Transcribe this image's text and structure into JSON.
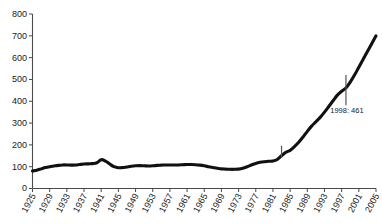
{
  "chart_data": {
    "type": "line",
    "title": "",
    "subtitle": "",
    "xlabel": "",
    "ylabel": "",
    "xlim": [
      1925,
      2005
    ],
    "ylim": [
      0,
      800
    ],
    "grid": false,
    "legend": null,
    "y_ticks": [
      0,
      100,
      200,
      300,
      400,
      500,
      600,
      700,
      800
    ],
    "y_tick_labels": [
      "0",
      "100",
      "200",
      "300",
      "400",
      "500",
      "600",
      "700",
      "800"
    ],
    "x_ticks": [
      1925,
      1929,
      1933,
      1937,
      1941,
      1945,
      1949,
      1953,
      1957,
      1961,
      1965,
      1969,
      1973,
      1977,
      1981,
      1985,
      1989,
      1993,
      1997,
      2001,
      2005
    ],
    "x_tick_labels": [
      "1925",
      "1929",
      "1933",
      "1937",
      "1941",
      "1945",
      "1949",
      "1953",
      "1957",
      "1961",
      "1965",
      "1969",
      "1973",
      "1977",
      "1981",
      "1985",
      "1989",
      "1993",
      "1997",
      "2001",
      "2005"
    ],
    "series": [
      {
        "name": "value",
        "line_color": "#111111",
        "x": [
          1925,
          1926,
          1927,
          1928,
          1929,
          1930,
          1931,
          1932,
          1933,
          1934,
          1935,
          1936,
          1937,
          1938,
          1939,
          1940,
          1941,
          1942,
          1943,
          1944,
          1945,
          1946,
          1947,
          1948,
          1949,
          1950,
          1951,
          1952,
          1953,
          1954,
          1955,
          1956,
          1957,
          1958,
          1959,
          1960,
          1961,
          1962,
          1963,
          1964,
          1965,
          1966,
          1967,
          1968,
          1969,
          1970,
          1971,
          1972,
          1973,
          1974,
          1975,
          1976,
          1977,
          1978,
          1979,
          1980,
          1981,
          1982,
          1983,
          1984,
          1985,
          1986,
          1987,
          1988,
          1989,
          1990,
          1991,
          1992,
          1993,
          1994,
          1995,
          1996,
          1997,
          1998,
          1999,
          2000,
          2001,
          2002,
          2003,
          2004,
          2005
        ],
        "values": [
          80,
          84,
          90,
          96,
          100,
          103,
          106,
          108,
          108,
          107,
          108,
          110,
          112,
          113,
          114,
          118,
          132,
          126,
          112,
          100,
          95,
          96,
          99,
          102,
          104,
          105,
          104,
          103,
          104,
          106,
          107,
          108,
          108,
          108,
          108,
          109,
          110,
          110,
          109,
          107,
          104,
          100,
          96,
          93,
          90,
          89,
          88,
          88,
          89,
          93,
          100,
          108,
          115,
          120,
          123,
          125,
          126,
          133,
          150,
          166,
          175,
          192,
          212,
          236,
          262,
          286,
          306,
          326,
          350,
          376,
          402,
          428,
          446,
          461,
          488,
          520,
          556,
          592,
          628,
          664,
          700
        ]
      }
    ],
    "annotations": [
      {
        "name": "marker-1983",
        "x": 1983,
        "y_top": 196,
        "y_bottom": 142,
        "label": ""
      },
      {
        "name": "marker-1998",
        "x": 1998,
        "y_top": 520,
        "y_bottom": 382,
        "label": "1998: 461"
      }
    ],
    "annotation_label": "1998: 461"
  },
  "axes": {
    "y_axis_name": "y-axis",
    "x_axis_name": "x-axis"
  }
}
